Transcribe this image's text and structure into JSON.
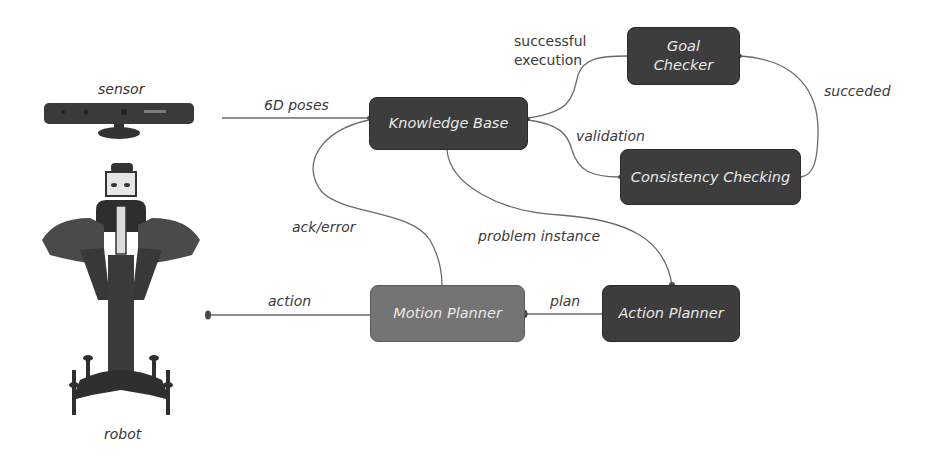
{
  "diagram": {
    "nodes": {
      "knowledge_base": "Knowledge Base",
      "goal_checker_line1": "Goal",
      "goal_checker_line2": "Checker",
      "consistency_checking": "Consistency Checking",
      "motion_planner": "Motion Planner",
      "action_planner": "Action Planner"
    },
    "edge_labels": {
      "six_d_poses": "6D poses",
      "successful_execution_line1": "successful",
      "successful_execution_line2": "execution",
      "validation": "validation",
      "succeded": "succeded",
      "ack_error": "ack/error",
      "problem_instance": "problem instance",
      "action": "action",
      "plan": "plan"
    },
    "images": {
      "sensor_label": "sensor",
      "robot_label": "robot"
    },
    "colors": {
      "node_dark": "#3d3d3d",
      "node_mid": "#747474",
      "node_text": "#e8e8e8",
      "edge": "#6a6a6a",
      "label_text": "#3a3a3a"
    }
  }
}
